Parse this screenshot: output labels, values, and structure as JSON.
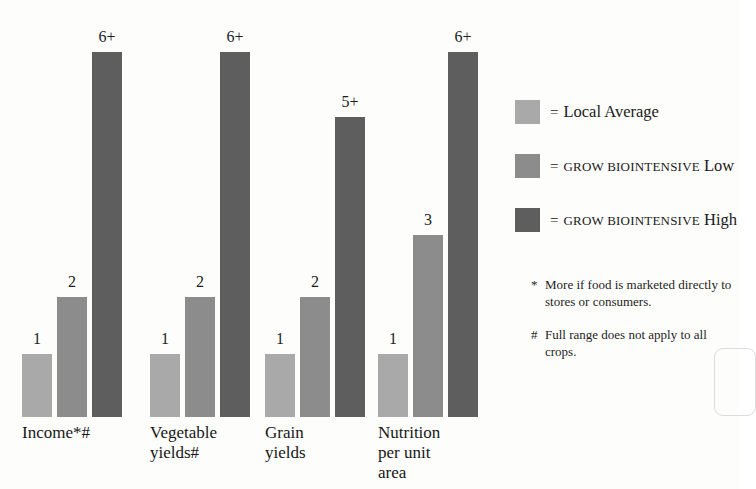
{
  "chart_data": {
    "type": "bar",
    "title": "",
    "subtitle": "",
    "xlabel": "",
    "ylabel": "",
    "grid": false,
    "legend_position": "right",
    "ylim": [
      0,
      6.5
    ],
    "categories": [
      "Income*#",
      "Vegetable\nyields#",
      "Grain\nyields",
      "Nutrition\nper unit\narea"
    ],
    "series": [
      {
        "name": "Local Average",
        "color": "#a9a9a9",
        "values": [
          1,
          1,
          1,
          1
        ],
        "labels": [
          "1",
          "1",
          "1",
          "1"
        ]
      },
      {
        "name": "GROW BIOINTENSIVE Low",
        "color": "#8c8c8c",
        "values": [
          2,
          2,
          2,
          3
        ],
        "labels": [
          "2",
          "2",
          "2",
          "3"
        ]
      },
      {
        "name": "GROW BIOINTENSIVE High",
        "color": "#5e5e5e",
        "values": [
          6,
          6,
          5,
          6
        ],
        "labels": [
          "6+",
          "6+",
          "5+",
          "6+"
        ]
      }
    ],
    "annotations": [
      "* More if food is marketed directly to stores or consumers.",
      "# Full range does not apply to all crops."
    ]
  },
  "legend": {
    "items": [
      {
        "eq": "=",
        "prefix": "",
        "suffix": "Local Average",
        "color": "#a9a9a9",
        "swatch_name": "legend-swatch-local-average"
      },
      {
        "eq": "=",
        "prefix": "GROW BIOINTENSIVE",
        "suffix": "Low",
        "color": "#8c8c8c",
        "swatch_name": "legend-swatch-gb-low"
      },
      {
        "eq": "=",
        "prefix": "GROW BIOINTENSIVE",
        "suffix": "High",
        "color": "#5e5e5e",
        "swatch_name": "legend-swatch-gb-high"
      }
    ]
  },
  "footnotes": [
    {
      "mark": "*",
      "text": "More if food is marketed directly to stores or consumers."
    },
    {
      "mark": "#",
      "text": "Full range does not apply to all crops."
    }
  ],
  "groups": [
    {
      "label": "Income*#",
      "left": 22,
      "label_left": 22,
      "bars": [
        {
          "left": 0,
          "height": 63,
          "color": "#a9a9a9",
          "label": "1",
          "label_bottom": 70
        },
        {
          "left": 35,
          "height": 120,
          "color": "#8c8c8c",
          "label": "2",
          "label_bottom": 127
        },
        {
          "left": 70,
          "height": 365,
          "color": "#5e5e5e",
          "label": "6+",
          "label_bottom": 372
        }
      ]
    },
    {
      "label": "Vegetable\nyields#",
      "left": 150,
      "label_left": 150,
      "bars": [
        {
          "left": 0,
          "height": 63,
          "color": "#a9a9a9",
          "label": "1",
          "label_bottom": 70
        },
        {
          "left": 35,
          "height": 120,
          "color": "#8c8c8c",
          "label": "2",
          "label_bottom": 127
        },
        {
          "left": 70,
          "height": 365,
          "color": "#5e5e5e",
          "label": "6+",
          "label_bottom": 372
        }
      ]
    },
    {
      "label": "Grain\nyields",
      "left": 265,
      "label_left": 265,
      "bars": [
        {
          "left": 0,
          "height": 63,
          "color": "#a9a9a9",
          "label": "1",
          "label_bottom": 70
        },
        {
          "left": 35,
          "height": 120,
          "color": "#8c8c8c",
          "label": "2",
          "label_bottom": 127
        },
        {
          "left": 70,
          "height": 300,
          "color": "#5e5e5e",
          "label": "5+",
          "label_bottom": 307
        }
      ]
    },
    {
      "label": "Nutrition\nper unit\narea",
      "left": 378,
      "label_left": 378,
      "bars": [
        {
          "left": 0,
          "height": 63,
          "color": "#a9a9a9",
          "label": "1",
          "label_bottom": 70
        },
        {
          "left": 35,
          "height": 182,
          "color": "#8c8c8c",
          "label": "3",
          "label_bottom": 189
        },
        {
          "left": 70,
          "height": 365,
          "color": "#5e5e5e",
          "label": "6+",
          "label_bottom": 372
        }
      ]
    }
  ]
}
